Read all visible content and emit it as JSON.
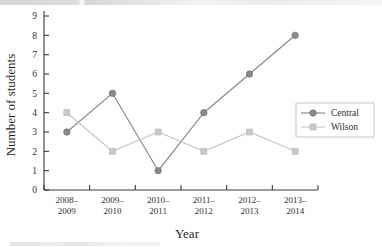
{
  "chart_data": {
    "type": "line",
    "title": "",
    "xlabel": "Year",
    "ylabel": "Number of students",
    "categories": [
      "2008–\n2009",
      "2009–\n2010",
      "2010–\n2011",
      "2011–\n2012",
      "2012–\n2013",
      "2013–\n2014"
    ],
    "categories_line1": [
      "2008–",
      "2009–",
      "2010–",
      "2011–",
      "2012–",
      "2013–"
    ],
    "categories_line2": [
      "2009",
      "2010",
      "2011",
      "2012",
      "2013",
      "2014"
    ],
    "ylim": [
      0,
      9
    ],
    "yticks": [
      0,
      1,
      2,
      3,
      4,
      5,
      6,
      7,
      8,
      9
    ],
    "grid": false,
    "legend_position": "right",
    "series": [
      {
        "name": "Central",
        "values": [
          3,
          5,
          1,
          4,
          6,
          8
        ],
        "color": "#8a8a8a",
        "marker": "circle"
      },
      {
        "name": "Wilson",
        "values": [
          4,
          2,
          3,
          2,
          3,
          2
        ],
        "color": "#c9c9c9",
        "marker": "square"
      }
    ]
  },
  "axes": {
    "y_title": "Number of students",
    "x_title": "Year"
  },
  "legend": {
    "items": [
      {
        "label": "Central"
      },
      {
        "label": "Wilson"
      }
    ]
  },
  "colors": {
    "central": "#8a8a8a",
    "wilson": "#c9c9c9",
    "axis": "#3a3a3a",
    "text": "#2f2f2f",
    "background": "#ffffff"
  }
}
